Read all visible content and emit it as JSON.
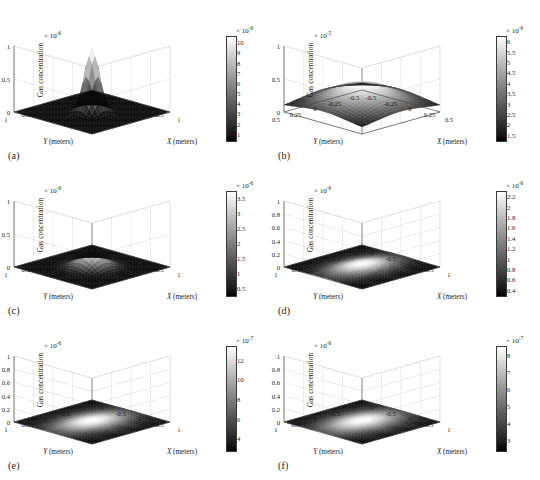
{
  "figure": {
    "type": "multi-panel-3d-surface-grid",
    "rows": 3,
    "cols": 2,
    "background": "#ffffff",
    "colormap": "grayscale-black-to-white",
    "shared": {
      "zlabel": "Gas concentration",
      "xlabel_var": "X",
      "ylabel_var": "Y",
      "axis_units": "(meters)",
      "exp_prefix": "× 10"
    }
  },
  "chart_data": [
    {
      "panel": "(a)",
      "type": "surface",
      "title": "",
      "xlabel": "X (meters)",
      "ylabel": "Y (meters)",
      "zlabel": "Gas concentration",
      "z_exponent": "-6",
      "z_exp_text": "× 10",
      "xlim": [
        -1,
        1
      ],
      "ylim": [
        -1,
        1
      ],
      "zlim": [
        0,
        1
      ],
      "x_ticks": [
        -1,
        -0.5,
        0,
        0.5,
        1
      ],
      "x_ticklabels": [
        "-1",
        "-0.5",
        "0",
        "0.5",
        "1"
      ],
      "y_ticks": [
        -1,
        -0.5,
        0,
        0.5,
        1
      ],
      "y_ticklabels": [
        "1",
        "0.5",
        "0",
        "-0.5",
        "-1"
      ],
      "z_ticks": [
        0,
        0.5,
        1
      ],
      "z_ticklabels": [
        "0",
        "0.5",
        "1"
      ],
      "grid": true,
      "peak_shape": "sharp-narrow-spike",
      "peak_height_norm": 0.97,
      "peak_width_norm": 0.16,
      "colorbar": {
        "exponent": "-6",
        "exp_text": "× 10",
        "ticks": [
          1,
          2,
          3,
          4,
          5,
          6,
          7,
          8,
          9,
          10
        ],
        "ticklabels": [
          "1",
          "2",
          "3",
          "4",
          "5",
          "6",
          "7",
          "8",
          "9",
          "10"
        ],
        "vmin": 0.4,
        "vmax": 10.6
      }
    },
    {
      "panel": "(b)",
      "type": "surface",
      "title": "",
      "xlabel": "X (meters)",
      "ylabel": "Y (meters)",
      "zlabel": "Gas concentration",
      "z_exponent": "-5",
      "z_exp_text": "× 10",
      "xlim": [
        -0.5,
        0.5
      ],
      "ylim": [
        -0.5,
        0.5
      ],
      "zlim": [
        0,
        1
      ],
      "x_ticks": [
        -0.5,
        -0.25,
        0,
        0.25,
        0.5
      ],
      "x_ticklabels": [
        "-0.5",
        "-0.25",
        "0",
        "0.25",
        "0.5"
      ],
      "y_ticks": [
        -0.5,
        -0.25,
        0,
        0.25,
        0.5
      ],
      "y_ticklabels": [
        "0.5",
        "0.25",
        "0",
        "-0.25",
        "-0.5"
      ],
      "z_ticks": [
        0,
        0.5,
        1
      ],
      "z_ticklabels": [
        "0",
        "0.5",
        "1"
      ],
      "grid": true,
      "peak_shape": "broad-dome-raised-edges",
      "peak_height_norm": 0.46,
      "peak_width_norm": 0.62,
      "colorbar": {
        "exponent": "-6",
        "exp_text": "× 10",
        "ticks": [
          1.5,
          2,
          2.5,
          3,
          3.5,
          4,
          4.5,
          5,
          5.5,
          6
        ],
        "ticklabels": [
          "1.5",
          "2",
          "2.5",
          "3",
          "3.5",
          "4",
          "4.5",
          "5",
          "5.5",
          "6"
        ],
        "vmin": 1.25,
        "vmax": 6.25
      }
    },
    {
      "panel": "(c)",
      "type": "surface",
      "title": "",
      "xlabel": "X (meters)",
      "ylabel": "Y (meters)",
      "zlabel": "Gas concentration",
      "z_exponent": "-6",
      "z_exp_text": "× 10",
      "xlim": [
        -1,
        1
      ],
      "ylim": [
        -1,
        1
      ],
      "zlim": [
        0,
        1
      ],
      "x_ticks": [
        -1,
        -0.5,
        0,
        0.5,
        1
      ],
      "x_ticklabels": [
        "-1",
        "-0.5",
        "0",
        "0.5",
        "1"
      ],
      "y_ticks": [
        -1,
        -0.5,
        0,
        0.5,
        1
      ],
      "y_ticklabels": [
        "1",
        "0.5",
        "0",
        "-0.5",
        "-1"
      ],
      "z_ticks": [
        0,
        0.5,
        1
      ],
      "z_ticklabels": [
        "0",
        "0.5",
        "1"
      ],
      "grid": true,
      "peak_shape": "low-blunt-peak",
      "peak_height_norm": 0.27,
      "peak_width_norm": 0.26,
      "colorbar": {
        "exponent": "-6",
        "exp_text": "× 10",
        "ticks": [
          0.5,
          1,
          1.5,
          2,
          2.5,
          3,
          3.5
        ],
        "ticklabels": [
          "0.5",
          "1",
          "1.5",
          "2",
          "2.5",
          "3",
          "3.5"
        ],
        "vmin": 0.25,
        "vmax": 3.75
      }
    },
    {
      "panel": "(d)",
      "type": "surface",
      "title": "",
      "xlabel": "X (meters)",
      "ylabel": "Y (meters)",
      "zlabel": "Gas concentration",
      "z_exponent": "-6",
      "z_exp_text": "× 10",
      "xlim": [
        -1,
        1
      ],
      "ylim": [
        -1,
        1
      ],
      "zlim": [
        0,
        1
      ],
      "x_ticks": [
        -1,
        -0.5,
        0,
        0.5,
        1
      ],
      "x_ticklabels": [
        "-1",
        "-0.5",
        "0",
        "0.5",
        "1"
      ],
      "y_ticks": [
        -1,
        -0.5,
        0,
        0.5,
        1
      ],
      "y_ticklabels": [
        "1",
        "0.5",
        "0",
        "-0.5",
        "-1"
      ],
      "z_ticks": [
        0,
        0.2,
        0.4,
        0.6,
        0.8,
        1
      ],
      "z_ticklabels": [
        "0",
        "0.2",
        "0.4",
        "0.6",
        "0.8",
        "1"
      ],
      "grid": true,
      "peak_shape": "flat-plane-diffuse-glow",
      "peak_height_norm": 0.06,
      "peak_width_norm": 0.5,
      "colorbar": {
        "exponent": "-6",
        "exp_text": "× 10",
        "ticks": [
          0.4,
          0.6,
          0.8,
          1,
          1.2,
          1.4,
          1.6,
          1.8,
          2,
          2.2
        ],
        "ticklabels": [
          "0.4",
          "0.6",
          "0.8",
          "1",
          "1.2",
          "1.4",
          "1.6",
          "1.8",
          "2",
          "2.2"
        ],
        "vmin": 0.3,
        "vmax": 2.3
      }
    },
    {
      "panel": "(e)",
      "type": "surface",
      "title": "",
      "xlabel": "X (meters)",
      "ylabel": "Y (meters)",
      "zlabel": "Gas concentration",
      "z_exponent": "-6",
      "z_exp_text": "× 10",
      "xlim": [
        -1,
        1
      ],
      "ylim": [
        -1,
        1
      ],
      "zlim": [
        0,
        1
      ],
      "x_ticks": [
        -1,
        -0.5,
        0,
        0.5,
        1
      ],
      "x_ticklabels": [
        "-1",
        "-0.5",
        "0",
        "0.5",
        "1"
      ],
      "y_ticks": [
        -1,
        -0.5,
        0,
        0.5,
        1
      ],
      "y_ticklabels": [
        "1",
        "0.5",
        "0",
        "-0.5",
        "-1"
      ],
      "z_ticks": [
        0,
        0.2,
        0.4,
        0.6,
        0.8,
        1
      ],
      "z_ticklabels": [
        "0",
        "0.2",
        "0.4",
        "0.6",
        "0.8",
        "1"
      ],
      "grid": true,
      "peak_shape": "flat-plane-elliptical-glow",
      "peak_height_norm": 0.03,
      "peak_width_norm": 0.55,
      "colorbar": {
        "exponent": "-7",
        "exp_text": "× 10",
        "ticks": [
          4,
          6,
          8,
          10,
          12
        ],
        "ticklabels": [
          "4",
          "6",
          "8",
          "10",
          "12"
        ],
        "vmin": 2.8,
        "vmax": 13.4
      }
    },
    {
      "panel": "(f)",
      "type": "surface",
      "title": "",
      "xlabel": "X (meters)",
      "ylabel": "Y (meters)",
      "zlabel": "Gas concentration",
      "z_exponent": "-6",
      "z_exp_text": "× 10",
      "xlim": [
        -1,
        1
      ],
      "ylim": [
        -1,
        1
      ],
      "zlim": [
        0,
        1
      ],
      "x_ticks": [
        -1,
        -0.5,
        0,
        0.5,
        1
      ],
      "x_ticklabels": [
        "-1",
        "-0.5",
        "0",
        "0.5",
        "1"
      ],
      "y_ticks": [
        -1,
        -0.5,
        0,
        0.5,
        1
      ],
      "y_ticklabels": [
        "1",
        "0.5",
        "0",
        "-0.5",
        "-1"
      ],
      "z_ticks": [
        0,
        0.2,
        0.4,
        0.6,
        0.8,
        1
      ],
      "z_ticklabels": [
        "0",
        "0.2",
        "0.4",
        "0.6",
        "0.8",
        "1"
      ],
      "grid": true,
      "peak_shape": "flat-plane-elliptical-glow",
      "peak_height_norm": 0.03,
      "peak_width_norm": 0.58,
      "colorbar": {
        "exponent": "-7",
        "exp_text": "× 10",
        "ticks": [
          3,
          4,
          5,
          6,
          7,
          8
        ],
        "ticklabels": [
          "3",
          "4",
          "5",
          "6",
          "7",
          "8"
        ],
        "vmin": 2.4,
        "vmax": 8.5
      }
    }
  ]
}
